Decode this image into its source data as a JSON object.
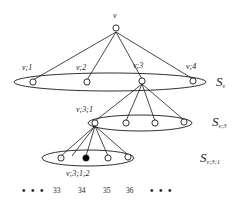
{
  "figure": {
    "type": "tree-diagram",
    "background_color": "#ffffff",
    "stroke_color": "#1a1a1a",
    "node_fill_open": "#ffffff",
    "node_fill_marked": "#000000",
    "root": {
      "label": "v",
      "x": 116,
      "y": 28
    },
    "levels": [
      {
        "set_label_main": "S",
        "set_label_sub": "v",
        "set_label_x": 218,
        "set_label_y": 76,
        "ellipse": {
          "cx": 110,
          "cy": 82,
          "rx": 96,
          "ry": 9
        },
        "nodes": [
          {
            "label": "v;1",
            "x": 33,
            "y": 82,
            "filled": false,
            "label_x": 22,
            "label_y": 66
          },
          {
            "label": "v;2",
            "x": 87,
            "y": 82,
            "filled": false,
            "label_x": 76,
            "label_y": 66
          },
          {
            "label": "v;3",
            "x": 142,
            "y": 81,
            "filled": false,
            "label_x": 133,
            "label_y": 64
          },
          {
            "label": "v;4",
            "x": 193,
            "y": 81,
            "filled": false,
            "label_x": 186,
            "label_y": 65
          }
        ]
      },
      {
        "set_label_main": "S",
        "set_label_sub": "v;3",
        "set_label_x": 214,
        "set_label_y": 116,
        "ellipse": {
          "cx": 140,
          "cy": 123,
          "rx": 52,
          "ry": 8
        },
        "nodes": [
          {
            "label": "v;3;1",
            "x": 95,
            "y": 123,
            "filled": false,
            "label_x": 76,
            "label_y": 108
          },
          {
            "label": "",
            "x": 126,
            "y": 123,
            "filled": false
          },
          {
            "label": "",
            "x": 155,
            "y": 123,
            "filled": false
          },
          {
            "label": "",
            "x": 184,
            "y": 122,
            "filled": false
          }
        ]
      },
      {
        "set_label_main": "S",
        "set_label_sub": "v;3;1",
        "set_label_x": 204,
        "set_label_y": 152,
        "ellipse": {
          "cx": 88,
          "cy": 158,
          "rx": 46,
          "ry": 8
        },
        "nodes": [
          {
            "label": "",
            "x": 61,
            "y": 158,
            "filled": false
          },
          {
            "label": "v;3;1;2",
            "x": 86,
            "y": 158,
            "filled": true,
            "label_x": 68,
            "label_y": 170
          },
          {
            "label": "",
            "x": 108,
            "y": 158,
            "filled": false
          },
          {
            "label": "",
            "x": 128,
            "y": 157,
            "filled": false
          }
        ]
      }
    ],
    "bottom_row": {
      "left_dots": "• • •",
      "right_dots": "• • •",
      "left_dots_x": 25,
      "right_dots_x": 150,
      "y": 188,
      "numbers": [
        {
          "text": "33",
          "x": 53
        },
        {
          "text": "34",
          "x": 78
        },
        {
          "text": "35",
          "x": 103
        },
        {
          "text": "36",
          "x": 126
        }
      ]
    }
  }
}
